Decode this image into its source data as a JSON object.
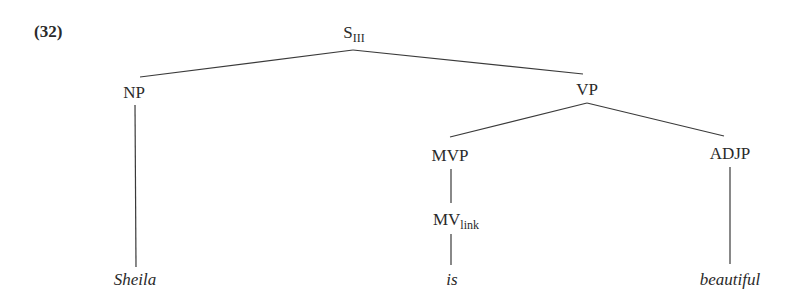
{
  "example": {
    "number": "(32)"
  },
  "tree": {
    "root": {
      "label": "S",
      "subscript": "III"
    },
    "np": {
      "label": "NP"
    },
    "vp": {
      "label": "VP"
    },
    "mvp": {
      "label": "MVP"
    },
    "mv": {
      "label": "MV",
      "subscript": "link"
    },
    "adjp": {
      "label": "ADJP"
    },
    "leaves": {
      "sheila": "Sheila",
      "is": "is",
      "beautiful": "beautiful"
    }
  },
  "structure": "[S_III [NP Sheila] [VP [MVP [MV_link is]] [ADJP beautiful]]]"
}
